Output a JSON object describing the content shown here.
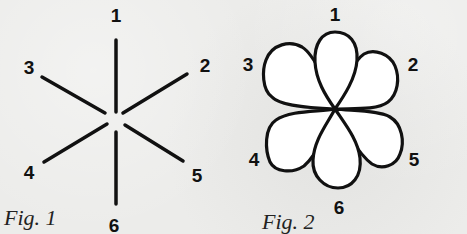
{
  "figures": [
    {
      "caption": "Fig. 1",
      "description": "Six lines radiating from a center point",
      "labels": [
        "1",
        "2",
        "3",
        "4",
        "5",
        "6"
      ]
    },
    {
      "caption": "Fig. 2",
      "description": "Six petals arranged around a center point forming a flower",
      "labels": [
        "1",
        "2",
        "3",
        "4",
        "5",
        "6"
      ]
    }
  ],
  "colors": {
    "ink": "#111111",
    "paper": "#ececea",
    "petal_fill": "#ffffff"
  }
}
